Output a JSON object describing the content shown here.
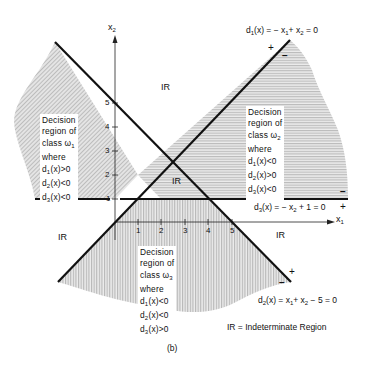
{
  "figure": {
    "caption": "(b)",
    "axes": {
      "x_label": "x",
      "x_sub": "1",
      "y_label": "x",
      "y_sub": "2",
      "x_ticks": [
        "1",
        "2",
        "3",
        "4",
        "5"
      ],
      "y_ticks": [
        "1",
        "2",
        "3",
        "4",
        "5"
      ]
    },
    "boundaries": {
      "d1": {
        "text_pre": "d",
        "sub": "1",
        "text_mid": "(x) = − x",
        "sub2": "1",
        "text_mid2": "+ x",
        "sub3": "2",
        "text_post": " = 0",
        "plus": "+",
        "minus": "−"
      },
      "d2": {
        "text_pre": "d",
        "sub": "2",
        "text_mid": "(x) = x",
        "sub2": "1",
        "text_mid2": "+ x",
        "sub3": "2",
        "text_post": " − 5 = 0",
        "plus": "+",
        "minus": "−"
      },
      "d3": {
        "text_pre": "d",
        "sub": "3",
        "text_mid": "(x) = − x",
        "sub2": "2",
        "text_post": " + 1 = 0",
        "plus": "+",
        "minus": "−"
      }
    },
    "regions": {
      "class1": {
        "lines": [
          "Decision",
          "region of",
          "class ω",
          "where"
        ],
        "class_sub": "1",
        "conds": [
          {
            "d": "1",
            "rel": "(x)>0"
          },
          {
            "d": "2",
            "rel": "(x)<0"
          },
          {
            "d": "3",
            "rel": "(x)<0"
          }
        ]
      },
      "class2": {
        "lines": [
          "Decision",
          "region of",
          "class ω",
          "where"
        ],
        "class_sub": "2",
        "conds": [
          {
            "d": "1",
            "rel": "(x)<0"
          },
          {
            "d": "2",
            "rel": "(x)>0"
          },
          {
            "d": "3",
            "rel": "(x)<0"
          }
        ]
      },
      "class3": {
        "lines": [
          "Decision",
          "region of",
          "class ω",
          "where"
        ],
        "class_sub": "3",
        "conds": [
          {
            "d": "1",
            "rel": "(x)<0"
          },
          {
            "d": "2",
            "rel": "(x)<0"
          },
          {
            "d": "3",
            "rel": "(x)>0"
          }
        ]
      }
    },
    "ir_labels": [
      "IR",
      "IR",
      "IR",
      "IR"
    ],
    "legend": "IR = Indeterminate Region"
  }
}
